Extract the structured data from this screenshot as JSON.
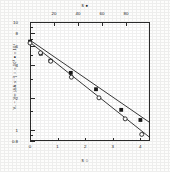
{
  "chart_data": {
    "type": "line",
    "title": "",
    "subtitle": "",
    "y_scale": "log",
    "ylabel": "V₀ − V∞ (ΔA·s⁻¹)  ○ = 10³  ● = 10⁴",
    "ylim": [
      0.8,
      10
    ],
    "ytick_labels": [
      "10",
      "8",
      "6",
      "4",
      "2",
      "1",
      "0.8"
    ],
    "ytick_values": [
      10,
      8,
      6,
      4,
      2,
      1,
      0.8
    ],
    "yminor_values": [
      9,
      7,
      5,
      3,
      1.5,
      0.9
    ],
    "grid": false,
    "legend": "none",
    "top_axis": {
      "label": "s  ●",
      "xlim": [
        0,
        100
      ],
      "tick_labels": [
        "20",
        "40",
        "60",
        "80"
      ],
      "tick_values": [
        20,
        40,
        60,
        80
      ]
    },
    "bottom_axis": {
      "label": "s  ○",
      "xlim": [
        0,
        4.35
      ],
      "tick_labels": [
        "0",
        "1",
        "2",
        "3",
        "4"
      ],
      "tick_values": [
        0,
        1,
        2,
        3,
        4
      ]
    },
    "series": [
      {
        "name": "filled-squares-upper",
        "marker": "filled-square",
        "axis": "top",
        "x": [
          0,
          9,
          17,
          34,
          55,
          76,
          92
        ],
        "y": [
          6.6,
          5.1,
          4.4,
          3.4,
          2.4,
          1.55,
          1.25
        ],
        "fit_line": {
          "x0": 0,
          "y0": 6.8,
          "x1": 100,
          "y1": 1.18
        }
      },
      {
        "name": "open-circles-lower",
        "marker": "open-circle",
        "axis": "bottom",
        "x": [
          0,
          0.38,
          0.75,
          1.5,
          2.5,
          3.45,
          4.05
        ],
        "y": [
          6.4,
          5.2,
          4.35,
          3.1,
          2.0,
          1.28,
          0.92
        ],
        "fit_line": {
          "x0": 0,
          "y0": 6.5,
          "x1": 4.35,
          "y1": 0.86
        }
      }
    ]
  }
}
